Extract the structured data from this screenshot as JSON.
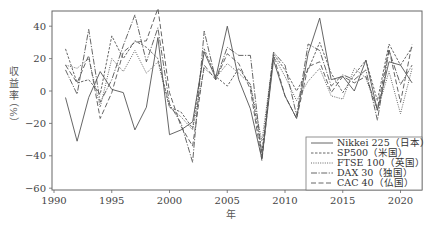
{
  "chart_data": {
    "type": "line",
    "title": "",
    "xlabel": "年",
    "ylabel": "収益率（%）",
    "xlim": [
      1990,
      2022
    ],
    "ylim": [
      -60,
      48
    ],
    "xticks": [
      1990,
      1995,
      2000,
      2005,
      2010,
      2015,
      2020
    ],
    "yticks": [
      -60,
      -40,
      -20,
      0,
      20,
      40
    ],
    "grid": false,
    "legend_position": "lower right",
    "x": [
      1991,
      1992,
      1993,
      1994,
      1995,
      1996,
      1997,
      1998,
      1999,
      2000,
      2001,
      2002,
      2003,
      2004,
      2005,
      2006,
      2007,
      2008,
      2009,
      2010,
      2011,
      2012,
      2013,
      2014,
      2015,
      2016,
      2017,
      2018,
      2019,
      2020,
      2021
    ],
    "series": [
      {
        "name": "Nikkei 225（日本）",
        "style": "solid",
        "values": [
          -4,
          -31,
          -4,
          12,
          1,
          -1,
          -24,
          -10,
          33,
          -27,
          -24,
          -19,
          24,
          8,
          40,
          7,
          -11,
          -42,
          19,
          -3,
          -17,
          23,
          45,
          7,
          9,
          0,
          19,
          -12,
          18,
          16,
          5
        ]
      },
      {
        "name": "SP500（米国）",
        "style": "dashed-short",
        "values": [
          26,
          5,
          7,
          -2,
          34,
          20,
          31,
          27,
          20,
          -10,
          -13,
          -23,
          26,
          9,
          3,
          14,
          4,
          -38,
          23,
          13,
          0,
          13,
          30,
          11,
          -1,
          10,
          19,
          -6,
          29,
          16,
          27
        ]
      },
      {
        "name": "FTSE 100（英国）",
        "style": "dotted",
        "values": [
          16,
          14,
          20,
          -10,
          20,
          12,
          25,
          11,
          18,
          -10,
          -16,
          -24,
          14,
          8,
          17,
          11,
          4,
          -31,
          22,
          9,
          -6,
          6,
          14,
          -3,
          -5,
          14,
          8,
          -12,
          12,
          -14,
          14
        ]
      },
      {
        "name": "DAX 30（独国）",
        "style": "dash-dot",
        "values": [
          13,
          -2,
          38,
          -7,
          7,
          28,
          47,
          18,
          39,
          -8,
          -20,
          -44,
          37,
          7,
          27,
          22,
          22,
          -40,
          24,
          16,
          -15,
          29,
          25,
          3,
          10,
          7,
          13,
          -18,
          25,
          4,
          16
        ]
      },
      {
        "name": "CAC 40（仏国）",
        "style": "dashed-long",
        "values": [
          16,
          5,
          22,
          -17,
          -1,
          24,
          30,
          31,
          51,
          -1,
          -22,
          -34,
          16,
          7,
          23,
          17,
          1,
          -43,
          22,
          -3,
          -17,
          15,
          18,
          -1,
          9,
          5,
          9,
          -11,
          26,
          -7,
          29
        ]
      }
    ]
  },
  "legend": {
    "items": [
      {
        "label": "Nikkei 225（日本）"
      },
      {
        "label": "SP500（米国）"
      },
      {
        "label": "FTSE 100（英国）"
      },
      {
        "label": "DAX 30（独国）"
      },
      {
        "label": "CAC 40（仏国）"
      }
    ]
  },
  "axes": {
    "xlabel": "年",
    "ylabel_chars": [
      "収",
      "益",
      "率"
    ],
    "ylabel_unit": "（%）"
  },
  "colors": {
    "line": "#555555",
    "frame": "#666666",
    "text": "#444444"
  }
}
